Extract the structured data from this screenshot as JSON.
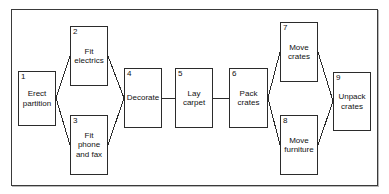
{
  "diagram": {
    "type": "flow-network",
    "style": {
      "node_fill": "#ffffff",
      "node_border": "#2b2b2b",
      "frame_border": "#3a3a3a",
      "connector_color": "#2b2b2b",
      "text_color": "#111111",
      "background": "#ffffff"
    },
    "nodes": [
      {
        "id": 1,
        "number": "1",
        "label": "Erect\npartition",
        "x": 18,
        "y": 71,
        "w": 38,
        "h": 55
      },
      {
        "id": 2,
        "number": "2",
        "label": "Fit\nelectrics",
        "x": 70,
        "y": 26,
        "w": 38,
        "h": 60
      },
      {
        "id": 3,
        "number": "3",
        "label": "Fit\nphone\nand fax",
        "x": 70,
        "y": 115,
        "w": 38,
        "h": 60
      },
      {
        "id": 4,
        "number": "4",
        "label": "Decorate",
        "x": 124,
        "y": 68,
        "w": 38,
        "h": 60
      },
      {
        "id": 5,
        "number": "5",
        "label": "Lay\ncarpet",
        "x": 175,
        "y": 68,
        "w": 38,
        "h": 60
      },
      {
        "id": 6,
        "number": "6",
        "label": "Pack\ncrates",
        "x": 229,
        "y": 68,
        "w": 39,
        "h": 60
      },
      {
        "id": 7,
        "number": "7",
        "label": "Move\ncrates",
        "x": 280,
        "y": 22,
        "w": 38,
        "h": 60
      },
      {
        "id": 8,
        "number": "8",
        "label": "Move\nfurniture",
        "x": 280,
        "y": 115,
        "w": 38,
        "h": 60
      },
      {
        "id": 9,
        "number": "9",
        "label": "Unpack\ncrates",
        "x": 333,
        "y": 72,
        "w": 38,
        "h": 59
      }
    ],
    "edges": [
      {
        "from": 1,
        "to": 2,
        "x1": 56,
        "y1": 98,
        "x2": 70,
        "y2": 56
      },
      {
        "from": 1,
        "to": 3,
        "x1": 56,
        "y1": 98,
        "x2": 70,
        "y2": 145
      },
      {
        "from": 2,
        "to": 4,
        "x1": 108,
        "y1": 56,
        "x2": 124,
        "y2": 98
      },
      {
        "from": 3,
        "to": 4,
        "x1": 108,
        "y1": 145,
        "x2": 124,
        "y2": 98
      },
      {
        "from": 4,
        "to": 5,
        "x1": 162,
        "y1": 98,
        "x2": 175,
        "y2": 98
      },
      {
        "from": 5,
        "to": 6,
        "x1": 213,
        "y1": 98,
        "x2": 229,
        "y2": 98
      },
      {
        "from": 6,
        "to": 7,
        "x1": 268,
        "y1": 98,
        "x2": 280,
        "y2": 52
      },
      {
        "from": 6,
        "to": 8,
        "x1": 268,
        "y1": 98,
        "x2": 280,
        "y2": 145
      },
      {
        "from": 7,
        "to": 9,
        "x1": 318,
        "y1": 52,
        "x2": 333,
        "y2": 101
      },
      {
        "from": 8,
        "to": 9,
        "x1": 318,
        "y1": 145,
        "x2": 333,
        "y2": 101
      }
    ]
  }
}
